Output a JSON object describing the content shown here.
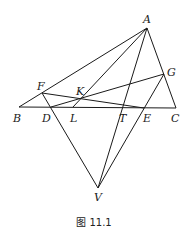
{
  "figure": {
    "caption": "图 11.1",
    "points": {
      "A": {
        "label": "A",
        "x": 147,
        "y": 28,
        "lx": 143,
        "ly": 23
      },
      "B": {
        "label": "B",
        "x": 19,
        "y": 107,
        "lx": 13,
        "ly": 122
      },
      "C": {
        "label": "C",
        "x": 176,
        "y": 108,
        "lx": 171,
        "ly": 122
      },
      "D": {
        "label": "D",
        "x": 51,
        "y": 107,
        "lx": 42,
        "ly": 122
      },
      "L": {
        "label": "L",
        "x": 73,
        "y": 107,
        "lx": 70,
        "ly": 122
      },
      "T": {
        "label": "T",
        "x": 122,
        "y": 107,
        "lx": 119,
        "ly": 122
      },
      "E": {
        "label": "E",
        "x": 144,
        "y": 108,
        "lx": 143,
        "ly": 122
      },
      "F": {
        "label": "F",
        "x": 42,
        "y": 93,
        "lx": 37,
        "ly": 90
      },
      "G": {
        "label": "G",
        "x": 164,
        "y": 74,
        "lx": 167,
        "ly": 76
      },
      "K": {
        "label": "K",
        "x": 81,
        "y": 98,
        "lx": 76,
        "ly": 95
      },
      "V": {
        "label": "V",
        "x": 98,
        "y": 188,
        "lx": 94,
        "ly": 201
      }
    },
    "segments": [
      [
        "B",
        "C"
      ],
      [
        "A",
        "B"
      ],
      [
        "A",
        "C"
      ],
      [
        "A",
        "L"
      ],
      [
        "A",
        "V"
      ],
      [
        "F",
        "E"
      ],
      [
        "D",
        "G"
      ],
      [
        "F",
        "V"
      ],
      [
        "G",
        "V"
      ]
    ]
  }
}
